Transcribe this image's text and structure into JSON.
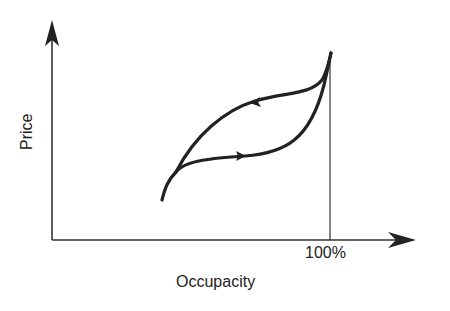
{
  "diagram": {
    "type": "hysteresis-loop",
    "y_axis_label": "Price",
    "x_axis_label": "Occupacity",
    "x_marker_label": "100%",
    "colors": {
      "line": "#222222",
      "background": "#ffffff"
    },
    "curves": [
      {
        "name": "rising-path",
        "direction": "increasing occupancy",
        "arrow": "right"
      },
      {
        "name": "falling-path",
        "direction": "decreasing occupancy",
        "arrow": "left"
      }
    ]
  }
}
